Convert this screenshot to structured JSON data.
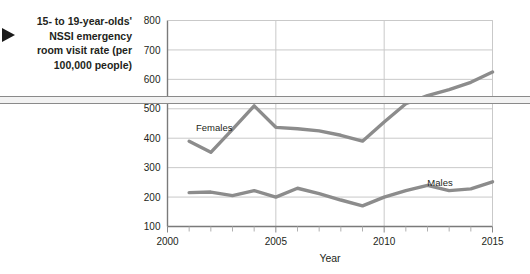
{
  "caption": {
    "text": "15- to 19-year-olds' NSSI emergency room visit rate (per 100,000 people)",
    "marker": "right-triangle"
  },
  "chart_data": {
    "type": "line",
    "title": "",
    "xlabel": "Year",
    "ylabel": "",
    "xlim": [
      2000,
      2015
    ],
    "ylim": [
      100,
      800
    ],
    "ytick_step": 100,
    "yticks": [
      100,
      200,
      300,
      400,
      500,
      600,
      700,
      800
    ],
    "xticks": [
      2000,
      2005,
      2010,
      2015
    ],
    "xticks_minor": [
      2001,
      2002,
      2003,
      2004,
      2006,
      2007,
      2008,
      2009,
      2011,
      2012,
      2013,
      2014
    ],
    "x": [
      2001,
      2002,
      2003,
      2004,
      2005,
      2006,
      2007,
      2008,
      2009,
      2010,
      2011,
      2012,
      2013,
      2014,
      2015
    ],
    "grid": true,
    "legend_position": "inline-annotation",
    "line_color": "#8c8c8c",
    "grid_color": "#c9c9c9",
    "axis_color": "#808080",
    "series": [
      {
        "name": "Females",
        "label": "Females",
        "values": [
          390,
          352,
          430,
          510,
          437,
          432,
          425,
          410,
          390,
          455,
          517,
          545,
          565,
          590,
          625
        ]
      },
      {
        "name": "Males",
        "label": "Males",
        "values": [
          215,
          217,
          205,
          222,
          200,
          230,
          212,
          190,
          170,
          200,
          222,
          240,
          222,
          228,
          252
        ]
      }
    ]
  },
  "axis_tick_text": {
    "y": [
      "800",
      "700",
      "600",
      "500",
      "400",
      "300",
      "200",
      "100"
    ],
    "x": [
      "2000",
      "2005",
      "2010",
      "2015"
    ]
  },
  "axis_titles": {
    "x": "Year"
  },
  "series_labels": {
    "females": "Females",
    "males": "Males"
  }
}
